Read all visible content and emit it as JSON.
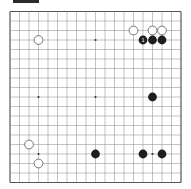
{
  "board": {
    "size": 19,
    "origin_x": 10,
    "origin_y": 11.5,
    "spacing": 9.5,
    "line_color": "#9a9a9a",
    "border_color": "#555555",
    "star_color": "#333333",
    "black_color": "#1e1e1e",
    "white_fill": "#ffffff",
    "white_stroke": "#555555",
    "star_points": [
      [
        3,
        3
      ],
      [
        9,
        3
      ],
      [
        15,
        3
      ],
      [
        3,
        9
      ],
      [
        9,
        9
      ],
      [
        15,
        9
      ],
      [
        3,
        15
      ],
      [
        9,
        15
      ],
      [
        15,
        15
      ]
    ],
    "stones": [
      {
        "color": "white",
        "col": 3,
        "row": 3
      },
      {
        "color": "white",
        "col": 13,
        "row": 2
      },
      {
        "color": "white",
        "col": 15,
        "row": 2
      },
      {
        "color": "white",
        "col": 16,
        "row": 2
      },
      {
        "color": "black",
        "col": 14,
        "row": 3,
        "label": "1"
      },
      {
        "color": "black",
        "col": 15,
        "row": 3
      },
      {
        "color": "black",
        "col": 16,
        "row": 3
      },
      {
        "color": "black",
        "col": 15,
        "row": 9
      },
      {
        "color": "white",
        "col": 2,
        "row": 14
      },
      {
        "color": "white",
        "col": 3,
        "row": 16
      },
      {
        "color": "black",
        "col": 9,
        "row": 15
      },
      {
        "color": "black",
        "col": 14,
        "row": 15
      },
      {
        "color": "black",
        "col": 16,
        "row": 15
      }
    ]
  }
}
